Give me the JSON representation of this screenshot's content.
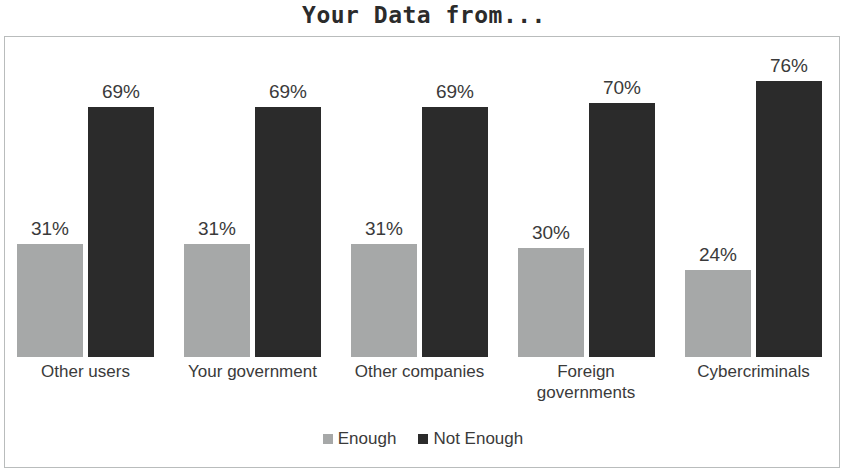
{
  "chart_data": {
    "type": "bar",
    "title": "Your Data from...",
    "xlabel": "",
    "ylabel": "",
    "ylim": [
      0,
      80
    ],
    "grid": false,
    "legend_position": "bottom-center",
    "value_suffix": "%",
    "categories": [
      "Other users",
      "Your government",
      "Other companies",
      "Foreign governments",
      "Cybercriminals"
    ],
    "series": [
      {
        "name": "Enough",
        "color": "#a6a8a8",
        "values": [
          31,
          31,
          31,
          30,
          24
        ],
        "labels": [
          "31%",
          "31%",
          "31%",
          "30%",
          "24%"
        ]
      },
      {
        "name": "Not Enough",
        "color": "#2b2b2b",
        "values": [
          69,
          69,
          69,
          70,
          76
        ],
        "labels": [
          "69%",
          "69%",
          "69%",
          "70%",
          "76%"
        ]
      }
    ]
  },
  "title": "Your Data from...",
  "legend": {
    "items": [
      {
        "label": "Enough"
      },
      {
        "label": "Not Enough"
      }
    ]
  },
  "groups": [
    {
      "category": "Other users",
      "bars": [
        {
          "series": "Enough",
          "label": "31%"
        },
        {
          "series": "Not Enough",
          "label": "69%"
        }
      ]
    },
    {
      "category": "Your government",
      "bars": [
        {
          "series": "Enough",
          "label": "31%"
        },
        {
          "series": "Not Enough",
          "label": "69%"
        }
      ]
    },
    {
      "category": "Other companies",
      "bars": [
        {
          "series": "Enough",
          "label": "31%"
        },
        {
          "series": "Not Enough",
          "label": "69%"
        }
      ]
    },
    {
      "category": "Foreign governments",
      "bars": [
        {
          "series": "Enough",
          "label": "30%"
        },
        {
          "series": "Not Enough",
          "label": "70%"
        }
      ]
    },
    {
      "category": "Cybercriminals",
      "bars": [
        {
          "series": "Enough",
          "label": "24%"
        },
        {
          "series": "Not Enough",
          "label": "76%"
        }
      ]
    }
  ]
}
